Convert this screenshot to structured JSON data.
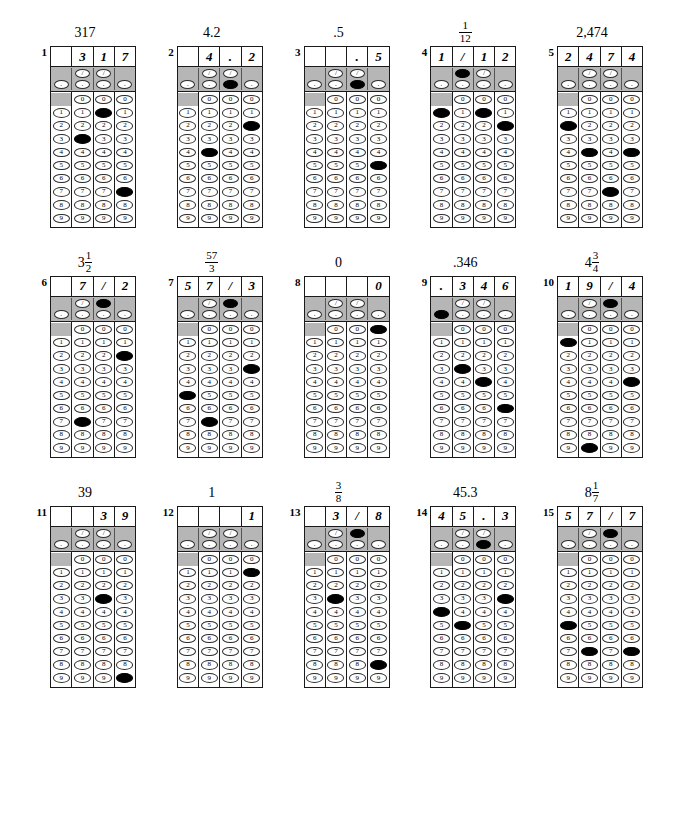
{
  "sheet": {
    "title": "Student-Produced Response Grids",
    "columns_per_grid": 4,
    "digit_rows": [
      "0",
      "1",
      "2",
      "3",
      "4",
      "5",
      "6",
      "7",
      "8",
      "9"
    ],
    "slash_glyph": "/",
    "decimal_glyph": ".",
    "colors": {
      "shaded_band": "#b6b6b6",
      "border": "#1a1a1a",
      "filled_bubble": "#000000",
      "paper": "#ffffff"
    }
  },
  "grids": [
    {
      "number": "1",
      "answer_label": "317",
      "answer_type": "integer",
      "written": [
        "",
        "3",
        "1",
        "7"
      ],
      "slash_marked": [
        false,
        false,
        false,
        false
      ],
      "decimal_marked": [
        false,
        false,
        false,
        false
      ],
      "digit_marked": [
        null,
        "3",
        "1",
        "7"
      ]
    },
    {
      "number": "2",
      "answer_label": "4.2",
      "answer_type": "decimal",
      "written": [
        "",
        "4",
        ".",
        "2"
      ],
      "slash_marked": [
        false,
        false,
        false,
        false
      ],
      "decimal_marked": [
        false,
        false,
        true,
        false
      ],
      "digit_marked": [
        null,
        "4",
        null,
        "2"
      ]
    },
    {
      "number": "3",
      "answer_label": ".5",
      "answer_type": "decimal",
      "written": [
        "",
        "",
        ".",
        "5"
      ],
      "slash_marked": [
        false,
        false,
        false,
        false
      ],
      "decimal_marked": [
        false,
        false,
        true,
        false
      ],
      "digit_marked": [
        null,
        null,
        null,
        "5"
      ]
    },
    {
      "number": "4",
      "answer_label_type": "fraction",
      "answer_whole": "",
      "answer_num": "1",
      "answer_den": "12",
      "answer_label": "1/12",
      "written": [
        "1",
        "/",
        "1",
        "2"
      ],
      "slash_marked": [
        false,
        true,
        false,
        false
      ],
      "decimal_marked": [
        false,
        false,
        false,
        false
      ],
      "digit_marked": [
        "1",
        null,
        "1",
        "2"
      ]
    },
    {
      "number": "5",
      "answer_label": "2,474",
      "answer_type": "integer",
      "written": [
        "2",
        "4",
        "7",
        "4"
      ],
      "slash_marked": [
        false,
        false,
        false,
        false
      ],
      "decimal_marked": [
        false,
        false,
        false,
        false
      ],
      "digit_marked": [
        "2",
        "4",
        "7",
        "4"
      ]
    },
    {
      "number": "6",
      "answer_label_type": "mixed",
      "answer_whole": "3",
      "answer_num": "1",
      "answer_den": "2",
      "answer_label": "3 1/2",
      "written": [
        "",
        "7",
        "/",
        "2"
      ],
      "slash_marked": [
        false,
        false,
        true,
        false
      ],
      "decimal_marked": [
        false,
        false,
        false,
        false
      ],
      "digit_marked": [
        null,
        "7",
        null,
        "2"
      ]
    },
    {
      "number": "7",
      "answer_label_type": "fraction",
      "answer_whole": "",
      "answer_num": "57",
      "answer_den": "3",
      "answer_label": "57/3",
      "written": [
        "5",
        "7",
        "/",
        "3"
      ],
      "slash_marked": [
        false,
        false,
        true,
        false
      ],
      "decimal_marked": [
        false,
        false,
        false,
        false
      ],
      "digit_marked": [
        "5",
        "7",
        null,
        "3"
      ]
    },
    {
      "number": "8",
      "answer_label": "0",
      "answer_type": "integer",
      "written": [
        "",
        "",
        "",
        "0"
      ],
      "slash_marked": [
        false,
        false,
        false,
        false
      ],
      "decimal_marked": [
        false,
        false,
        false,
        false
      ],
      "digit_marked": [
        null,
        null,
        null,
        "0"
      ]
    },
    {
      "number": "9",
      "answer_label": ".346",
      "answer_type": "decimal",
      "written": [
        ".",
        "3",
        "4",
        "6"
      ],
      "slash_marked": [
        false,
        false,
        false,
        false
      ],
      "decimal_marked": [
        true,
        false,
        false,
        false
      ],
      "digit_marked": [
        null,
        "3",
        "4",
        "6"
      ]
    },
    {
      "number": "10",
      "answer_label_type": "mixed",
      "answer_whole": "4",
      "answer_num": "3",
      "answer_den": "4",
      "answer_label": "4 3/4",
      "written": [
        "1",
        "9",
        "/",
        "4"
      ],
      "slash_marked": [
        false,
        false,
        true,
        false
      ],
      "decimal_marked": [
        false,
        false,
        false,
        false
      ],
      "digit_marked": [
        "1",
        "9",
        null,
        "4"
      ]
    },
    {
      "number": "11",
      "answer_label": "39",
      "answer_type": "integer",
      "written": [
        "",
        "",
        "3",
        "9"
      ],
      "slash_marked": [
        false,
        false,
        false,
        false
      ],
      "decimal_marked": [
        false,
        false,
        false,
        false
      ],
      "digit_marked": [
        null,
        null,
        "3",
        "9"
      ]
    },
    {
      "number": "12",
      "answer_label": "1",
      "answer_type": "integer",
      "written": [
        "",
        "",
        "",
        "1"
      ],
      "slash_marked": [
        false,
        false,
        false,
        false
      ],
      "decimal_marked": [
        false,
        false,
        false,
        false
      ],
      "digit_marked": [
        null,
        null,
        null,
        "1"
      ]
    },
    {
      "number": "13",
      "answer_label_type": "fraction",
      "answer_whole": "",
      "answer_num": "3",
      "answer_den": "8",
      "answer_label": "3/8",
      "written": [
        "",
        "3",
        "/",
        "8"
      ],
      "slash_marked": [
        false,
        false,
        true,
        false
      ],
      "decimal_marked": [
        false,
        false,
        false,
        false
      ],
      "digit_marked": [
        null,
        "3",
        null,
        "8"
      ]
    },
    {
      "number": "14",
      "answer_label": "45.3",
      "answer_type": "decimal",
      "written": [
        "4",
        "5",
        ".",
        "3"
      ],
      "slash_marked": [
        false,
        false,
        false,
        false
      ],
      "decimal_marked": [
        false,
        false,
        true,
        false
      ],
      "digit_marked": [
        "4",
        "5",
        null,
        "3"
      ]
    },
    {
      "number": "15",
      "answer_label_type": "mixed",
      "answer_whole": "8",
      "answer_num": "1",
      "answer_den": "7",
      "answer_label": "8 1/7",
      "written": [
        "5",
        "7",
        "/",
        "7"
      ],
      "slash_marked": [
        false,
        false,
        true,
        false
      ],
      "decimal_marked": [
        false,
        false,
        false,
        false
      ],
      "digit_marked": [
        "5",
        "7",
        null,
        "7"
      ]
    }
  ]
}
